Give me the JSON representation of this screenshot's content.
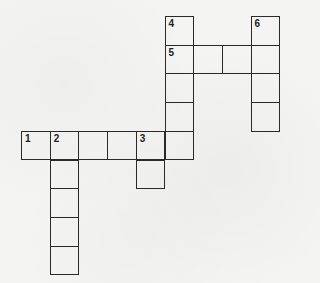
{
  "puzzle": {
    "type": "crossword",
    "cell_size": 28.7,
    "origin": {
      "x": 21,
      "y": 16
    },
    "line_color": "#2a2a2a",
    "background_color": "#f4f4f3",
    "clues": [
      {
        "number": "1",
        "direction": "across",
        "row": 4,
        "col": 0,
        "length": 6
      },
      {
        "number": "2",
        "direction": "down",
        "row": 4,
        "col": 1,
        "length": 5
      },
      {
        "number": "3",
        "direction": "down",
        "row": 4,
        "col": 4,
        "length": 2
      },
      {
        "number": "4",
        "direction": "down",
        "row": 0,
        "col": 5,
        "length": 5
      },
      {
        "number": "5",
        "direction": "across",
        "row": 1,
        "col": 5,
        "length": 4
      },
      {
        "number": "6",
        "direction": "down",
        "row": 0,
        "col": 8,
        "length": 4
      }
    ],
    "cells": [
      {
        "row": 0,
        "col": 5,
        "number": "4",
        "value": ""
      },
      {
        "row": 0,
        "col": 8,
        "number": "6",
        "value": ""
      },
      {
        "row": 1,
        "col": 5,
        "number": "5",
        "value": ""
      },
      {
        "row": 1,
        "col": 6,
        "number": "",
        "value": ""
      },
      {
        "row": 1,
        "col": 7,
        "number": "",
        "value": ""
      },
      {
        "row": 1,
        "col": 8,
        "number": "",
        "value": ""
      },
      {
        "row": 2,
        "col": 5,
        "number": "",
        "value": ""
      },
      {
        "row": 2,
        "col": 8,
        "number": "",
        "value": ""
      },
      {
        "row": 3,
        "col": 5,
        "number": "",
        "value": ""
      },
      {
        "row": 3,
        "col": 8,
        "number": "",
        "value": ""
      },
      {
        "row": 4,
        "col": 0,
        "number": "1",
        "value": ""
      },
      {
        "row": 4,
        "col": 1,
        "number": "2",
        "value": ""
      },
      {
        "row": 4,
        "col": 2,
        "number": "",
        "value": ""
      },
      {
        "row": 4,
        "col": 3,
        "number": "",
        "value": ""
      },
      {
        "row": 4,
        "col": 4,
        "number": "3",
        "value": ""
      },
      {
        "row": 4,
        "col": 5,
        "number": "",
        "value": ""
      },
      {
        "row": 5,
        "col": 1,
        "number": "",
        "value": ""
      },
      {
        "row": 5,
        "col": 4,
        "number": "",
        "value": ""
      },
      {
        "row": 6,
        "col": 1,
        "number": "",
        "value": ""
      },
      {
        "row": 7,
        "col": 1,
        "number": "",
        "value": ""
      },
      {
        "row": 8,
        "col": 1,
        "number": "",
        "value": ""
      }
    ]
  }
}
